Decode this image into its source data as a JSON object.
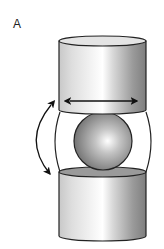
{
  "figure": {
    "panel_label": "A",
    "components": [
      {
        "name": "upper-cylinder"
      },
      {
        "name": "sphere"
      },
      {
        "name": "lower-cylinder"
      },
      {
        "name": "translation-arrow",
        "direction": "horizontal, bidirectional"
      },
      {
        "name": "rotation-arrow",
        "direction": "curved, bidirectional"
      }
    ],
    "colors": {
      "outline": "#222222",
      "cylinder_light": "#ffffff",
      "cylinder_mid": "#d4d4d4",
      "cylinder_dark": "#7e7e7e",
      "sphere_highlight": "#ffffff",
      "sphere_dark": "#6e6e6e",
      "cap_fill": "#e4e4e4",
      "lower_cap_fill": "#9a9a9a"
    }
  }
}
